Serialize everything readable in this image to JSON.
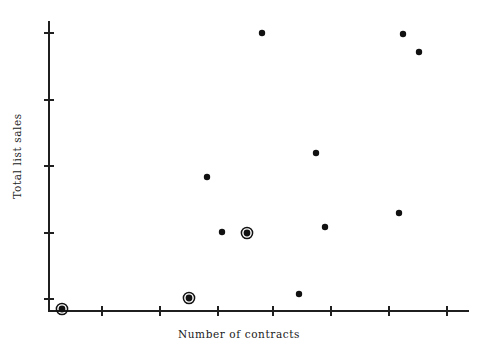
{
  "chart_data": {
    "type": "scatter",
    "title": "",
    "xlabel": "Number of contracts",
    "ylabel": "Total list sales",
    "grid": false,
    "legend": null,
    "tick_labels": {
      "x": [],
      "y": []
    },
    "axis_pixels": {
      "x_axis_y": 311,
      "y_axis_x": 49,
      "x_axis_left": 49,
      "x_axis_right": 468,
      "y_axis_top": 22,
      "y_axis_bottom": 311,
      "x_ticks_px": [
        102,
        160,
        218,
        273,
        331,
        389,
        447
      ],
      "y_ticks_px": [
        33,
        100,
        166,
        233,
        299
      ]
    },
    "marker_styles": {
      "plain": "filled-circle",
      "highlighted": "filled-circle-with-ring"
    },
    "points": [
      {
        "px": 62,
        "py": 309,
        "marker": "highlighted"
      },
      {
        "px": 189,
        "py": 298,
        "marker": "highlighted"
      },
      {
        "px": 247,
        "py": 233,
        "marker": "highlighted"
      },
      {
        "px": 207,
        "py": 177,
        "marker": "plain"
      },
      {
        "px": 222,
        "py": 232,
        "marker": "plain"
      },
      {
        "px": 262,
        "py": 33,
        "marker": "plain"
      },
      {
        "px": 299,
        "py": 294,
        "marker": "plain"
      },
      {
        "px": 316,
        "py": 153,
        "marker": "plain"
      },
      {
        "px": 325,
        "py": 227,
        "marker": "plain"
      },
      {
        "px": 399,
        "py": 213,
        "marker": "plain"
      },
      {
        "px": 403,
        "py": 34,
        "marker": "plain"
      },
      {
        "px": 419,
        "py": 52,
        "marker": "plain"
      }
    ]
  },
  "colors": {
    "background": "#ffffff",
    "axis": "#1f1f1f",
    "marker": "#111111"
  }
}
